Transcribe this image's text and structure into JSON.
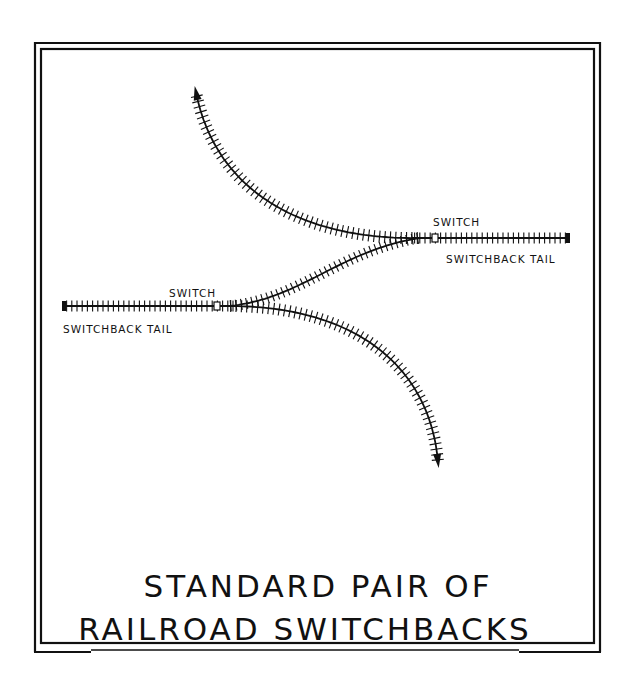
{
  "diagram": {
    "title_line1": "STANDARD PAIR OF",
    "title_line2": "RAILROAD SWITCHBACKS",
    "labels": {
      "upper_switch": "SWITCH",
      "upper_tail": "SWITCHBACK TAIL",
      "lower_switch": "SWITCH",
      "lower_tail": "SWITCHBACK TAIL"
    },
    "tracks": [
      {
        "name": "upper-switchback-tail",
        "kind": "straight",
        "end": "bumper"
      },
      {
        "name": "lower-switchback-tail",
        "kind": "straight",
        "end": "bumper"
      },
      {
        "name": "connecting-track",
        "kind": "s-curve"
      },
      {
        "name": "upper-exit-track",
        "kind": "curve",
        "end": "arrow"
      },
      {
        "name": "lower-exit-track",
        "kind": "curve",
        "end": "arrow"
      }
    ],
    "ink_color": "#111111",
    "background_color": "#ffffff"
  }
}
